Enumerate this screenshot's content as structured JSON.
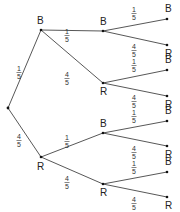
{
  "diagram": {
    "type": "probability-tree",
    "root": {
      "x": 8,
      "y": 108
    },
    "nodes": [
      {
        "id": "B1",
        "label": "B",
        "x": 41,
        "y": 30,
        "lx": 37,
        "ly": 24
      },
      {
        "id": "R1",
        "label": "R",
        "x": 41,
        "y": 157,
        "lx": 37,
        "ly": 170
      },
      {
        "id": "B1B",
        "label": "B",
        "x": 103,
        "y": 31,
        "lx": 100,
        "ly": 25
      },
      {
        "id": "B1R",
        "label": "R",
        "x": 103,
        "y": 83,
        "lx": 100,
        "ly": 95
      },
      {
        "id": "R1B",
        "label": "B",
        "x": 103,
        "y": 133,
        "lx": 100,
        "ly": 127
      },
      {
        "id": "R1R",
        "label": "R",
        "x": 103,
        "y": 184,
        "lx": 100,
        "ly": 196
      },
      {
        "id": "B1BB",
        "label": "B",
        "x": 167,
        "y": 19,
        "lx": 165,
        "ly": 12
      },
      {
        "id": "B1BR",
        "label": "R",
        "x": 167,
        "y": 45,
        "lx": 165,
        "ly": 57
      },
      {
        "id": "B1RB",
        "label": "B",
        "x": 167,
        "y": 70,
        "lx": 165,
        "ly": 63
      },
      {
        "id": "B1RR",
        "label": "R",
        "x": 167,
        "y": 96,
        "lx": 165,
        "ly": 108
      },
      {
        "id": "R1BB",
        "label": "B",
        "x": 167,
        "y": 121,
        "lx": 165,
        "ly": 114
      },
      {
        "id": "R1BR",
        "label": "R",
        "x": 167,
        "y": 146,
        "lx": 165,
        "ly": 158
      },
      {
        "id": "R1RB",
        "label": "B",
        "x": 167,
        "y": 172,
        "lx": 165,
        "ly": 165
      },
      {
        "id": "R1RR",
        "label": "R",
        "x": 167,
        "y": 197,
        "lx": 165,
        "ly": 209
      }
    ],
    "edges": [
      {
        "from": [
          8,
          108
        ],
        "to": [
          41,
          30
        ],
        "num": "1",
        "den": "5",
        "fx": 19,
        "fy": 72
      },
      {
        "from": [
          8,
          108
        ],
        "to": [
          41,
          157
        ],
        "num": "4",
        "den": "5",
        "fx": 19,
        "fy": 140
      },
      {
        "from": [
          41,
          30
        ],
        "to": [
          103,
          31
        ],
        "num": "1",
        "den": "5",
        "fx": 67,
        "fy": 35
      },
      {
        "from": [
          41,
          30
        ],
        "to": [
          103,
          83
        ],
        "num": "4",
        "den": "5",
        "fx": 67,
        "fy": 78
      },
      {
        "from": [
          41,
          157
        ],
        "to": [
          103,
          133
        ],
        "num": "1",
        "den": "5",
        "fx": 67,
        "fy": 141
      },
      {
        "from": [
          41,
          157
        ],
        "to": [
          103,
          184
        ],
        "num": "4",
        "den": "5",
        "fx": 67,
        "fy": 182
      },
      {
        "from": [
          103,
          31
        ],
        "to": [
          167,
          19
        ],
        "num": "1",
        "den": "5",
        "fx": 134,
        "fy": 13
      },
      {
        "from": [
          103,
          31
        ],
        "to": [
          167,
          45
        ],
        "num": "4",
        "den": "5",
        "fx": 134,
        "fy": 50
      },
      {
        "from": [
          103,
          83
        ],
        "to": [
          167,
          70
        ],
        "num": "1",
        "den": "5",
        "fx": 134,
        "fy": 65
      },
      {
        "from": [
          103,
          83
        ],
        "to": [
          167,
          96
        ],
        "num": "4",
        "den": "5",
        "fx": 134,
        "fy": 101
      },
      {
        "from": [
          103,
          133
        ],
        "to": [
          167,
          121
        ],
        "num": "1",
        "den": "5",
        "fx": 134,
        "fy": 116
      },
      {
        "from": [
          103,
          133
        ],
        "to": [
          167,
          146
        ],
        "num": "4",
        "den": "5",
        "fx": 134,
        "fy": 152
      },
      {
        "from": [
          103,
          184
        ],
        "to": [
          167,
          172
        ],
        "num": "1",
        "den": "5",
        "fx": 134,
        "fy": 167
      },
      {
        "from": [
          103,
          184
        ],
        "to": [
          167,
          197
        ],
        "num": "4",
        "den": "5",
        "fx": 134,
        "fy": 203
      }
    ]
  }
}
